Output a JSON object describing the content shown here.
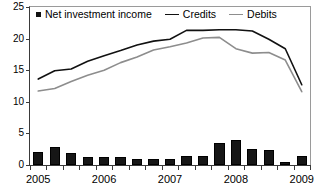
{
  "chart_data": {
    "type": "bar",
    "title": "",
    "xlabel": "",
    "ylabel": "",
    "ylim": [
      0,
      25
    ],
    "yticks": [
      0,
      5,
      10,
      15,
      20,
      25
    ],
    "grid": false,
    "legend_position": "top-left",
    "x_tick_labels": [
      "2005",
      "2006",
      "2007",
      "2008",
      "2009"
    ],
    "x_tick_label_positions": [
      0,
      4,
      8,
      12,
      16
    ],
    "x": [
      "2005Q1",
      "2005Q2",
      "2005Q3",
      "2005Q4",
      "2006Q1",
      "2006Q2",
      "2006Q3",
      "2006Q4",
      "2007Q1",
      "2007Q2",
      "2007Q3",
      "2007Q4",
      "2008Q1",
      "2008Q2",
      "2008Q3",
      "2008Q4",
      "2009Q1"
    ],
    "series": [
      {
        "name": "Net investment income",
        "render": "bar",
        "color": "#161616",
        "values": [
          2.0,
          2.8,
          1.9,
          1.3,
          1.2,
          1.3,
          0.9,
          0.9,
          1.0,
          1.5,
          1.4,
          3.5,
          3.9,
          2.5,
          2.4,
          0.4,
          1.5
        ]
      },
      {
        "name": "Credits",
        "render": "line",
        "color": "#111111",
        "values": [
          13.6,
          14.9,
          15.2,
          16.4,
          17.3,
          18.1,
          19.0,
          19.6,
          19.9,
          21.3,
          21.3,
          21.4,
          21.4,
          21.2,
          19.9,
          18.4,
          12.7
        ]
      },
      {
        "name": "Debits",
        "render": "line",
        "color": "#8d8d8d",
        "values": [
          11.7,
          12.1,
          13.2,
          14.2,
          15.0,
          16.2,
          17.1,
          18.2,
          18.7,
          19.3,
          20.1,
          20.2,
          18.4,
          17.7,
          17.8,
          16.6,
          11.6
        ]
      }
    ]
  },
  "legend": {
    "items": [
      {
        "label": "Net investment income",
        "marker": "square",
        "color": "#111111"
      },
      {
        "label": "Credits",
        "marker": "line",
        "color": "#111111"
      },
      {
        "label": "Debits",
        "marker": "line",
        "color": "#8d8d8d"
      }
    ]
  },
  "colors": {
    "credits": "#111111",
    "debits": "#8d8d8d",
    "bars": "#161616",
    "axis": "#3a3a3a",
    "frame": "#9a9a9a",
    "background": "#ffffff"
  }
}
